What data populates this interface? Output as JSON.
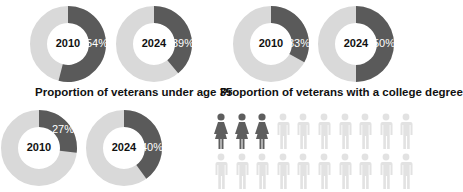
{
  "colors": {
    "dark": "#5a5a5a",
    "light": "#d9d9d9",
    "person_highlight": "#5e5e5e",
    "person_dim": "#e2e2e2"
  },
  "captions": {
    "under35": "Proportion of veterans under age 35",
    "college": "Proportion of veterans with a college degree"
  },
  "donuts": [
    {
      "group": "under35",
      "year": "2010",
      "pct_label": "54%",
      "value": 54
    },
    {
      "group": "under35",
      "year": "2024",
      "pct_label": "39%",
      "value": 39
    },
    {
      "group": "college",
      "year": "2010",
      "pct_label": "33%",
      "value": 33
    },
    {
      "group": "college",
      "year": "2024",
      "pct_label": "50%",
      "value": 50
    },
    {
      "group": "third",
      "year": "2010",
      "pct_label": "27%",
      "value": 27
    },
    {
      "group": "third",
      "year": "2024",
      "pct_label": "40%",
      "value": 40
    }
  ],
  "pictogram": {
    "rows": 2,
    "per_row": 10,
    "highlighted": 3,
    "highlight_shape": "woman",
    "dim_shape": "man"
  },
  "chart_data": [
    {
      "type": "pie",
      "title": "Proportion of veterans under age 35",
      "categories": [
        "2010",
        "2024"
      ],
      "values": [
        54,
        39
      ],
      "unit": "%",
      "style": "donut"
    },
    {
      "type": "pie",
      "title": "Proportion of veterans with a college degree",
      "categories": [
        "2010",
        "2024"
      ],
      "values": [
        33,
        50
      ],
      "unit": "%",
      "style": "donut"
    },
    {
      "type": "pie",
      "title": "",
      "categories": [
        "2010",
        "2024"
      ],
      "values": [
        27,
        40
      ],
      "unit": "%",
      "style": "donut"
    },
    {
      "type": "pictogram",
      "title": "",
      "total": 20,
      "highlighted": 3,
      "highlighted_label": "women"
    }
  ]
}
